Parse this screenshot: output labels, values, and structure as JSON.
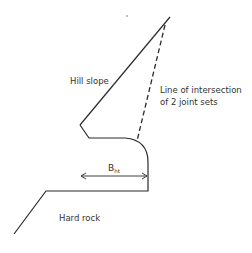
{
  "diagram": {
    "labels": {
      "hill_slope": "Hill slope",
      "intersection_line_1": "Line of intersection",
      "intersection_line_2": "of 2 joint sets",
      "width_symbol": "B",
      "width_subscript": "ht",
      "hard_rock": "Hard rock"
    },
    "colors": {
      "line": "#2a2a2a",
      "text": "#333333",
      "background": "#ffffff"
    }
  }
}
